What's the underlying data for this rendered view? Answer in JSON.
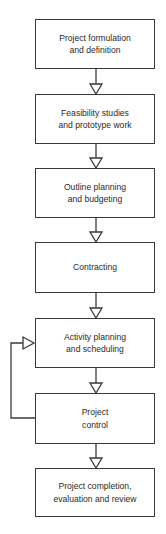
{
  "diagram": {
    "type": "flowchart",
    "direction": "top-to-bottom",
    "colors": {
      "line": "#3a3a3a",
      "text": "#2a2a2a",
      "background": "#ffffff"
    },
    "steps": [
      {
        "id": "s1",
        "label": "Project formulation\nand definition"
      },
      {
        "id": "s2",
        "label": "Feasibility studies\nand prototype work"
      },
      {
        "id": "s3",
        "label": "Outline planning\nand budgeting"
      },
      {
        "id": "s4",
        "label": "Contracting"
      },
      {
        "id": "s5",
        "label": "Activity planning\nand scheduling"
      },
      {
        "id": "s6",
        "label": "Project\ncontrol"
      },
      {
        "id": "s7",
        "label": "Project completion,\nevaluation and review"
      }
    ],
    "edges": [
      {
        "from": "s1",
        "to": "s2"
      },
      {
        "from": "s2",
        "to": "s3"
      },
      {
        "from": "s3",
        "to": "s4"
      },
      {
        "from": "s4",
        "to": "s5"
      },
      {
        "from": "s5",
        "to": "s6"
      },
      {
        "from": "s6",
        "to": "s7"
      },
      {
        "from": "s6",
        "to": "s5",
        "kind": "feedback-loop"
      }
    ]
  }
}
